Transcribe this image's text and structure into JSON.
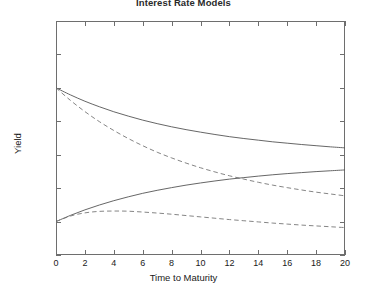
{
  "figure": {
    "title": "Interest Rate Models",
    "width": 367,
    "height": 298
  },
  "chart_data": {
    "type": "line",
    "title": "Interest Rate Models",
    "xlabel": "Time to Maturity",
    "ylabel": "Yield",
    "xlim": [
      0,
      20
    ],
    "ylim": [
      0,
      0.14
    ],
    "xticks": [
      0,
      2,
      4,
      6,
      8,
      10,
      12,
      14,
      16,
      18,
      20
    ],
    "xtick_labels": [
      "0",
      "2",
      "4",
      "6",
      "8",
      "10",
      "12",
      "14",
      "16",
      "18",
      "20"
    ],
    "yticks": [
      0,
      0.02,
      0.04,
      0.06,
      0.08,
      0.1,
      0.12,
      0.14
    ],
    "ytick_labels": [
      "0",
      "0.02",
      "0.04",
      "0.06",
      "0.08",
      "0.1",
      "0.12",
      "0.14"
    ],
    "grid": false,
    "legend": null,
    "line_color": "#555555",
    "series": [
      {
        "name": "high-start-solid",
        "style": "solid",
        "color": "#555555",
        "x": [
          0,
          1,
          2,
          3,
          4,
          5,
          6,
          7,
          8,
          9,
          10,
          11,
          12,
          13,
          14,
          15,
          16,
          17,
          18,
          19,
          20
        ],
        "values": [
          0.1,
          0.0958,
          0.092,
          0.0887,
          0.0857,
          0.0831,
          0.0807,
          0.0786,
          0.0767,
          0.075,
          0.0735,
          0.0721,
          0.0708,
          0.0697,
          0.0687,
          0.0677,
          0.0669,
          0.0661,
          0.0654,
          0.0647,
          0.0641
        ]
      },
      {
        "name": "high-start-dashed",
        "style": "dashed",
        "color": "#777777",
        "x": [
          0,
          1,
          2,
          3,
          4,
          5,
          6,
          7,
          8,
          9,
          10,
          11,
          12,
          13,
          14,
          15,
          16,
          17,
          18,
          19,
          20
        ],
        "values": [
          0.1,
          0.0925,
          0.0858,
          0.0798,
          0.0745,
          0.0697,
          0.0654,
          0.0615,
          0.0581,
          0.055,
          0.0522,
          0.0497,
          0.0474,
          0.0454,
          0.0435,
          0.0418,
          0.0403,
          0.0389,
          0.0376,
          0.0365,
          0.0354
        ]
      },
      {
        "name": "low-start-solid",
        "style": "solid",
        "color": "#555555",
        "x": [
          0,
          1,
          2,
          3,
          4,
          5,
          6,
          7,
          8,
          9,
          10,
          11,
          12,
          13,
          14,
          15,
          16,
          17,
          18,
          19,
          20
        ],
        "values": [
          0.02,
          0.0237,
          0.027,
          0.0299,
          0.0325,
          0.0348,
          0.0369,
          0.0387,
          0.0403,
          0.0418,
          0.0431,
          0.0443,
          0.0454,
          0.0463,
          0.0472,
          0.048,
          0.0487,
          0.0493,
          0.0499,
          0.0504,
          0.0509
        ]
      },
      {
        "name": "low-start-dashed-humped",
        "style": "dashed",
        "color": "#777777",
        "x": [
          0,
          1,
          2,
          3,
          4,
          5,
          6,
          7,
          8,
          9,
          10,
          11,
          12,
          13,
          14,
          15,
          16,
          17,
          18,
          19,
          20
        ],
        "values": [
          0.02,
          0.0233,
          0.0252,
          0.0261,
          0.0263,
          0.0262,
          0.0257,
          0.0251,
          0.0244,
          0.0236,
          0.0228,
          0.022,
          0.0212,
          0.0205,
          0.0198,
          0.0191,
          0.0185,
          0.0179,
          0.0174,
          0.0169,
          0.0164
        ]
      }
    ]
  }
}
